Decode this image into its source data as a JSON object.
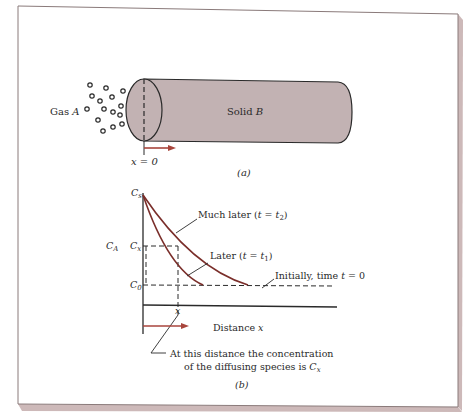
{
  "figure_a": {
    "gas_label": "Gas",
    "gas_symbol": "A",
    "solid_label": "Solid",
    "solid_symbol": "B",
    "origin_label": "x = 0",
    "caption": "(a)"
  },
  "figure_b": {
    "y_axis_label": "C_A",
    "y_ticks": {
      "cs": "C_s",
      "cx": "C_x",
      "c0": "C_0"
    },
    "x_tick": "x",
    "x_axis_label": "Distance x",
    "curves": [
      {
        "label": "Much later (t = t_2)",
        "text": "Much later (",
        "t": "t",
        "sub": "2"
      },
      {
        "label": "Later (t = t_1)",
        "text": "Later (",
        "t": "t",
        "sub": "1"
      },
      {
        "label": "Initially, time t = 0",
        "text": "Initially, time",
        "t": "t",
        "tail": "= 0"
      }
    ],
    "annotation_line1": "At this distance the concentration",
    "annotation_line2": "of the diffusing species is",
    "annotation_symbol": "C",
    "annotation_sub": "x",
    "caption": "(b)"
  },
  "colors": {
    "solid_fill": "#c2b2b3",
    "curve": "#7a2e2a",
    "arrow": "#a8453c",
    "frame_shadow": "#cdb9b9",
    "ink": "#2a2a2a"
  }
}
